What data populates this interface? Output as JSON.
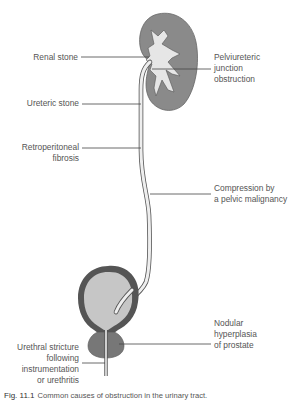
{
  "figure": {
    "labels": {
      "renal_stone": [
        "Renal stone"
      ],
      "pelviureteric": [
        "Pelviureteric",
        "junction",
        "obstruction"
      ],
      "ureteric_stone": [
        "Ureteric stone"
      ],
      "retroperitoneal": [
        "Retroperitoneal",
        "fibrosis"
      ],
      "compression": [
        "Compression by",
        "a pelvic malignancy"
      ],
      "nodular": [
        "Nodular",
        "hyperplasia",
        "of prostate"
      ],
      "urethral": [
        "Urethral stricture",
        "following",
        "instrumentation",
        "or urethritis"
      ]
    },
    "caption": {
      "number": "Fig. 11.1",
      "text": "Common causes of obstruction in the urinary tract."
    },
    "colors": {
      "tissue_dark": "#8a8a8a",
      "tissue_light": "#e4e4e4",
      "bladder_wall": "#555555",
      "bladder_fill": "#c4c4c4",
      "leader_line": "#444444"
    }
  }
}
